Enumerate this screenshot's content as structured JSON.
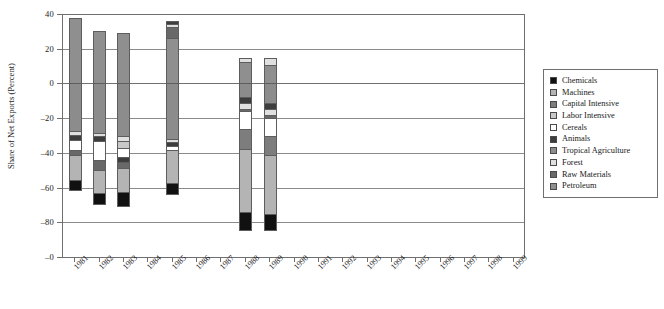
{
  "chart_data": {
    "type": "bar",
    "subtype": "stacked-diverging",
    "title": "",
    "xlabel": "",
    "ylabel": "Share of Net Exports (Percent)",
    "ylim": [
      -100,
      40
    ],
    "yticks": [
      40,
      20,
      0,
      -20,
      -40,
      -60,
      -80,
      -100
    ],
    "ytick_labels": [
      "40",
      "20",
      "0",
      "–20",
      "–40",
      "–60",
      "–80",
      "–0"
    ],
    "grid": true,
    "grid_axis": "y",
    "legend_position": "right",
    "categories": [
      "1981",
      "1982",
      "1983",
      "1984",
      "1985",
      "1986",
      "1987",
      "1988",
      "1989",
      "1990",
      "1991",
      "1992",
      "1993",
      "1994",
      "1995",
      "1996",
      "1997",
      "1998",
      "1999"
    ],
    "series": [
      {
        "name": "Chemicals",
        "color": "#111111",
        "values": [
          -6.0,
          -7.0,
          -8.5,
          null,
          -6.5,
          null,
          null,
          -11.0,
          -10.5,
          null,
          null,
          null,
          null,
          null,
          null,
          null,
          null,
          null,
          null
        ]
      },
      {
        "name": "Machines",
        "color": "#b4b4b4",
        "values": [
          -18.0,
          -21.0,
          -20.0,
          null,
          -19.5,
          null,
          null,
          -33.5,
          -31.0,
          null,
          null,
          null,
          null,
          null,
          null,
          null,
          null,
          null,
          null
        ]
      },
      {
        "name": "Capital Intensive",
        "color": "#7d7d7d",
        "values": [
          -2.0,
          -5.5,
          -5.5,
          null,
          -3.0,
          null,
          null,
          -8.0,
          -10.5,
          null,
          null,
          null,
          null,
          null,
          null,
          null,
          null,
          null,
          null
        ]
      },
      {
        "name": "Labor Intensive",
        "color": "#c8c8c8",
        "values": [
          -5.0,
          -2.5,
          -4.5,
          null,
          -4.5,
          null,
          null,
          -1.5,
          -2.0,
          null,
          null,
          null,
          null,
          null,
          null,
          null,
          null,
          null,
          null
        ]
      },
      {
        "name": "Cereals",
        "color": "#ffffff",
        "values": [
          -7.5,
          -8.5,
          -7.0,
          null,
          -2.5,
          null,
          null,
          -10.5,
          -10.0,
          null,
          null,
          null,
          null,
          null,
          null,
          null,
          null,
          null,
          null
        ]
      },
      {
        "name": "Animals",
        "color": "#3d3d3d",
        "values": [
          -2.5,
          -2.5,
          -2.5,
          null,
          -2.0,
          null,
          null,
          -2.0,
          -3.0,
          null,
          null,
          null,
          null,
          null,
          null,
          null,
          null,
          null,
          null
        ]
      },
      {
        "name": "Tropical Agriculture",
        "color": "#8c8c8c",
        "values": [
          -2.0,
          -1.5,
          -1.5,
          null,
          -1.5,
          null,
          null,
          -3.5,
          -3.0,
          null,
          null,
          null,
          null,
          null,
          null,
          null,
          null,
          null,
          null
        ]
      },
      {
        "name": "Forest",
        "color": "#e0e0e0",
        "values": [
          -2.0,
          -2.5,
          -3.5,
          null,
          -1.5,
          null,
          null,
          -3.5,
          -4.0,
          null,
          null,
          null,
          null,
          null,
          null,
          null,
          null,
          null,
          null
        ]
      },
      {
        "name": "Raw Materials",
        "color": "#686868",
        "values": [
          -2.0,
          -2.5,
          -2.5,
          null,
          -1.5,
          null,
          null,
          -5.0,
          -5.0,
          null,
          null,
          null,
          null,
          null,
          null,
          null,
          null,
          null,
          null
        ]
      },
      {
        "name": "Petroleum",
        "color": "#8f8f8f",
        "values": [
          37.5,
          30.0,
          29.0,
          null,
          36.0,
          null,
          null,
          14.5,
          14.5,
          null,
          null,
          null,
          null,
          null,
          null,
          null,
          null,
          null,
          null
        ]
      }
    ],
    "bars": [
      {
        "year": "1981",
        "total_positive": 37.5,
        "total_negative": -62.0,
        "positive_segments": [
          {
            "series": "Petroleum",
            "from": 0,
            "to": 37.5,
            "color": "#8f8f8f"
          }
        ],
        "negative_segments": [
          {
            "series": "Tropical Agriculture",
            "from": 0,
            "to": -27.5,
            "color": "#8c8c8c"
          },
          {
            "series": "Forest",
            "from": -27.5,
            "to": -29.5,
            "color": "#e0e0e0"
          },
          {
            "series": "Animals",
            "from": -29.5,
            "to": -32.5,
            "color": "#3d3d3d"
          },
          {
            "series": "Cereals",
            "from": -32.5,
            "to": -38.5,
            "color": "#ffffff"
          },
          {
            "series": "Raw Materials",
            "from": -38.5,
            "to": -41.0,
            "color": "#686868"
          },
          {
            "series": "Machines",
            "from": -41.0,
            "to": -55.5,
            "color": "#b4b4b4"
          },
          {
            "series": "Chemicals",
            "from": -55.5,
            "to": -62.0,
            "color": "#111111"
          }
        ]
      },
      {
        "year": "1982",
        "total_positive": 30.0,
        "total_negative": -70.0,
        "positive_segments": [
          {
            "series": "Petroleum",
            "from": 0,
            "to": 30.0,
            "color": "#8f8f8f"
          }
        ],
        "negative_segments": [
          {
            "series": "Tropical Agriculture",
            "from": 0,
            "to": -28.5,
            "color": "#8c8c8c"
          },
          {
            "series": "Forest",
            "from": -28.5,
            "to": -30.5,
            "color": "#e0e0e0"
          },
          {
            "series": "Animals",
            "from": -30.5,
            "to": -33.0,
            "color": "#3d3d3d"
          },
          {
            "series": "Cereals",
            "from": -33.0,
            "to": -44.0,
            "color": "#ffffff"
          },
          {
            "series": "Raw Materials",
            "from": -44.0,
            "to": -50.0,
            "color": "#686868"
          },
          {
            "series": "Machines",
            "from": -50.0,
            "to": -63.0,
            "color": "#b4b4b4"
          },
          {
            "series": "Chemicals",
            "from": -63.0,
            "to": -70.0,
            "color": "#111111"
          }
        ]
      },
      {
        "year": "1983",
        "total_positive": 29.0,
        "total_negative": -71.0,
        "positive_segments": [
          {
            "series": "Petroleum",
            "from": 0,
            "to": 29.0,
            "color": "#8f8f8f"
          }
        ],
        "negative_segments": [
          {
            "series": "Tropical Agriculture",
            "from": 0,
            "to": -30.5,
            "color": "#8c8c8c"
          },
          {
            "series": "Forest",
            "from": -30.5,
            "to": -33.0,
            "color": "#e0e0e0"
          },
          {
            "series": "Labor Intensive",
            "from": -33.0,
            "to": -37.0,
            "color": "#c8c8c8"
          },
          {
            "series": "Cereals",
            "from": -37.0,
            "to": -42.5,
            "color": "#ffffff"
          },
          {
            "series": "Animals",
            "from": -42.5,
            "to": -45.0,
            "color": "#3d3d3d"
          },
          {
            "series": "Raw Materials",
            "from": -45.0,
            "to": -48.5,
            "color": "#686868"
          },
          {
            "series": "Machines",
            "from": -48.5,
            "to": -62.5,
            "color": "#b4b4b4"
          },
          {
            "series": "Chemicals",
            "from": -62.5,
            "to": -71.0,
            "color": "#111111"
          }
        ]
      },
      {
        "year": "1985",
        "total_positive": 36.0,
        "total_negative": -64.0,
        "positive_segments": [
          {
            "series": "Petroleum",
            "from": 0,
            "to": 26.0,
            "color": "#8f8f8f"
          },
          {
            "series": "Raw Materials",
            "from": 26.0,
            "to": 32.5,
            "color": "#686868"
          },
          {
            "series": "Forest",
            "from": 32.5,
            "to": 34.0,
            "color": "#e0e0e0"
          },
          {
            "series": "Animals",
            "from": 34.0,
            "to": 36.0,
            "color": "#3d3d3d"
          }
        ],
        "negative_segments": [
          {
            "series": "Tropical Agriculture",
            "from": 0,
            "to": -32.0,
            "color": "#8c8c8c"
          },
          {
            "series": "Forest",
            "from": -32.0,
            "to": -34.0,
            "color": "#e0e0e0"
          },
          {
            "series": "Animals",
            "from": -34.0,
            "to": -36.0,
            "color": "#3d3d3d"
          },
          {
            "series": "Cereals",
            "from": -36.0,
            "to": -38.5,
            "color": "#ffffff"
          },
          {
            "series": "Machines",
            "from": -38.5,
            "to": -57.5,
            "color": "#b4b4b4"
          },
          {
            "series": "Chemicals",
            "from": -57.5,
            "to": -64.0,
            "color": "#111111"
          }
        ]
      },
      {
        "year": "1988",
        "total_positive": 14.5,
        "total_negative": -85.0,
        "positive_segments": [
          {
            "series": "Petroleum",
            "from": 0,
            "to": 12.5,
            "color": "#8f8f8f"
          },
          {
            "series": "Forest",
            "from": 12.5,
            "to": 14.5,
            "color": "#e0e0e0"
          }
        ],
        "negative_segments": [
          {
            "series": "Tropical Agriculture",
            "from": 0,
            "to": -8.0,
            "color": "#8c8c8c"
          },
          {
            "series": "Animals",
            "from": -8.0,
            "to": -11.0,
            "color": "#3d3d3d"
          },
          {
            "series": "Forest",
            "from": -11.0,
            "to": -14.5,
            "color": "#e0e0e0"
          },
          {
            "series": "Raw Materials",
            "from": -14.5,
            "to": -16.0,
            "color": "#686868"
          },
          {
            "series": "Cereals",
            "from": -16.0,
            "to": -26.5,
            "color": "#ffffff"
          },
          {
            "series": "Capital Intensive",
            "from": -26.5,
            "to": -38.0,
            "color": "#7d7d7d"
          },
          {
            "series": "Machines",
            "from": -38.0,
            "to": -74.0,
            "color": "#b4b4b4"
          },
          {
            "series": "Chemicals",
            "from": -74.0,
            "to": -85.0,
            "color": "#111111"
          }
        ]
      },
      {
        "year": "1989",
        "total_positive": 14.5,
        "total_negative": -85.0,
        "positive_segments": [
          {
            "series": "Petroleum",
            "from": 0,
            "to": 10.5,
            "color": "#8f8f8f"
          },
          {
            "series": "Forest",
            "from": 10.5,
            "to": 14.5,
            "color": "#e0e0e0"
          }
        ],
        "negative_segments": [
          {
            "series": "Tropical Agriculture",
            "from": 0,
            "to": -11.5,
            "color": "#8c8c8c"
          },
          {
            "series": "Animals",
            "from": -11.5,
            "to": -14.5,
            "color": "#3d3d3d"
          },
          {
            "series": "Forest",
            "from": -14.5,
            "to": -18.0,
            "color": "#e0e0e0"
          },
          {
            "series": "Raw Materials",
            "from": -18.0,
            "to": -20.0,
            "color": "#686868"
          },
          {
            "series": "Cereals",
            "from": -20.0,
            "to": -30.0,
            "color": "#ffffff"
          },
          {
            "series": "Capital Intensive",
            "from": -30.0,
            "to": -41.5,
            "color": "#7d7d7d"
          },
          {
            "series": "Machines",
            "from": -41.5,
            "to": -75.0,
            "color": "#b4b4b4"
          },
          {
            "series": "Chemicals",
            "from": -75.0,
            "to": -85.0,
            "color": "#111111"
          }
        ]
      }
    ]
  },
  "legend": {
    "items": [
      {
        "label": "Chemicals",
        "color": "#111111"
      },
      {
        "label": "Machines",
        "color": "#b4b4b4"
      },
      {
        "label": "Capital Intensive",
        "color": "#7d7d7d"
      },
      {
        "label": "Labor Intensive",
        "color": "#c8c8c8"
      },
      {
        "label": "Cereals",
        "color": "#ffffff"
      },
      {
        "label": "Animals",
        "color": "#3d3d3d"
      },
      {
        "label": "Tropical Agriculture",
        "color": "#8c8c8c"
      },
      {
        "label": "Forest",
        "color": "#e0e0e0"
      },
      {
        "label": "Raw Materials",
        "color": "#686868"
      },
      {
        "label": "Petroleum",
        "color": "#8f8f8f"
      }
    ]
  }
}
